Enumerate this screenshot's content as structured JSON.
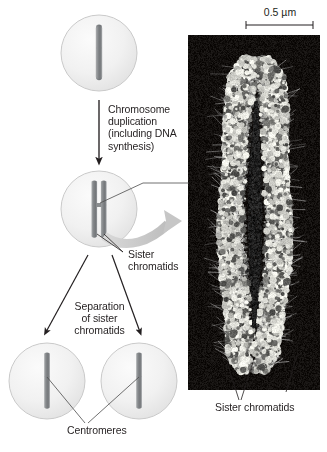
{
  "figure": {
    "type": "biology-diagram"
  },
  "colors": {
    "cell_fill": "#f2f2f2",
    "cell_stroke": "#c9c9c9",
    "chromosome_fill": "#8a8d8f",
    "chromosome_stroke": "#6e7173",
    "arrow_black": "#231f20",
    "arrow_grey": "#c6c6c6",
    "leader_line": "#4d4d4d",
    "micrograph_background": "#120f0d",
    "micrograph_chromatin": "#e8e6e1",
    "text": "#231f20"
  },
  "labels": {
    "step_duplication": "Chromosome\nduplication\n(including DNA\nsynthesis)",
    "sister_chromatids_diagram": "Sister\nchromatids",
    "step_separation": "Separation\nof sister\nchromatids",
    "centromeres": "Centromeres",
    "sister_chromatids_micrograph": "Sister chromatids",
    "scale_bar": "0.5 µm"
  },
  "stages": [
    {
      "name": "unduplicated-chromosome-cell",
      "caption": "",
      "chromatid_count": 1
    },
    {
      "name": "duplicated-chromosome-cell",
      "caption": "Sister\nchromatids",
      "chromatid_count": 2
    },
    {
      "name": "daughter-cell-left",
      "caption": "Centromeres",
      "chromatid_count": 1
    },
    {
      "name": "daughter-cell-right",
      "caption": "Centromeres",
      "chromatid_count": 1
    }
  ],
  "micrograph": {
    "caption": "Sister chromatids",
    "scale_bar_label": "0.5 µm",
    "subject": "duplicated metaphase chromosome, scanning electron micrograph"
  }
}
